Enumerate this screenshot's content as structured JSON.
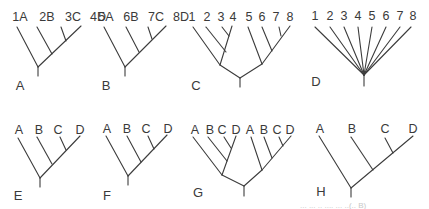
{
  "figure": {
    "background": "#ffffff",
    "line_color": "#3c3c3c",
    "text_color": "#3a3a3a",
    "trees": [
      {
        "panel": "A",
        "panel_pos": [
          20,
          90
        ],
        "tips": [
          "1A",
          "2B",
          "3C",
          "4D"
        ],
        "tip_label_pos": [
          [
            20,
            21
          ],
          [
            47,
            21
          ],
          [
            73,
            21
          ],
          [
            98,
            21
          ]
        ],
        "edges": [
          [
            17,
            27,
            38,
            67
          ],
          [
            37,
            27,
            52,
            54
          ],
          [
            61,
            27,
            66,
            41
          ],
          [
            81,
            26,
            38,
            67
          ],
          [
            38,
            67,
            38,
            76
          ]
        ]
      },
      {
        "panel": "B",
        "panel_pos": [
          106,
          90
        ],
        "tips": [
          "5A",
          "6B",
          "7C",
          "8D"
        ],
        "tip_label_pos": [
          [
            106,
            21
          ],
          [
            131,
            21
          ],
          [
            156,
            21
          ],
          [
            181,
            21
          ]
        ],
        "edges": [
          [
            104,
            27,
            125,
            67
          ],
          [
            126,
            27,
            139,
            52
          ],
          [
            148,
            27,
            152,
            39
          ],
          [
            166,
            26,
            125,
            67
          ],
          [
            125,
            67,
            125,
            76
          ]
        ]
      },
      {
        "panel": "C",
        "panel_pos": [
          196,
          90
        ],
        "tips": [
          "1",
          "2",
          "3",
          "4",
          "5",
          "6",
          "7",
          "8"
        ],
        "tip_label_pos": [
          [
            192,
            21
          ],
          [
            207,
            21
          ],
          [
            221,
            21
          ],
          [
            233,
            21
          ],
          [
            249,
            21
          ],
          [
            262,
            21
          ],
          [
            276,
            21
          ],
          [
            290,
            21
          ]
        ],
        "edges": [
          [
            193,
            27,
            220,
            65
          ],
          [
            206,
            27,
            226,
            52
          ],
          [
            222,
            27,
            229,
            36
          ],
          [
            232,
            26,
            220,
            65
          ],
          [
            248,
            27,
            262,
            64
          ],
          [
            262,
            27,
            272,
            51
          ],
          [
            279,
            27,
            281,
            36
          ],
          [
            290,
            26,
            262,
            64
          ],
          [
            220,
            65,
            240,
            78
          ],
          [
            262,
            64,
            240,
            78
          ],
          [
            240,
            78,
            240,
            87
          ]
        ]
      },
      {
        "panel": "D",
        "panel_pos": [
          316,
          86
        ],
        "tips": [
          "1",
          "2",
          "3",
          "4",
          "5",
          "6",
          "7",
          "8"
        ],
        "tip_label_pos": [
          [
            315,
            20
          ],
          [
            330,
            20
          ],
          [
            344,
            20
          ],
          [
            358,
            20
          ],
          [
            372,
            20
          ],
          [
            386,
            20
          ],
          [
            400,
            20
          ],
          [
            413,
            20
          ]
        ],
        "edges": [
          [
            315,
            27,
            364,
            75
          ],
          [
            330,
            27,
            364,
            75
          ],
          [
            344,
            27,
            364,
            75
          ],
          [
            358,
            27,
            364,
            75
          ],
          [
            372,
            27,
            364,
            75
          ],
          [
            386,
            27,
            364,
            75
          ],
          [
            400,
            27,
            364,
            75
          ],
          [
            411,
            27,
            364,
            75
          ],
          [
            364,
            75,
            364,
            86
          ]
        ]
      },
      {
        "panel": "E",
        "panel_pos": [
          18,
          200
        ],
        "tips": [
          "A",
          "B",
          "C",
          "D"
        ],
        "tip_label_pos": [
          [
            19,
            134
          ],
          [
            39,
            134
          ],
          [
            58,
            134
          ],
          [
            80,
            134
          ]
        ],
        "edges": [
          [
            18,
            138,
            40,
            178
          ],
          [
            37,
            137,
            52,
            164
          ],
          [
            60,
            137,
            66,
            150
          ],
          [
            80,
            136,
            40,
            178
          ],
          [
            40,
            178,
            40,
            187
          ]
        ]
      },
      {
        "panel": "F",
        "panel_pos": [
          107,
          200
        ],
        "tips": [
          "A",
          "B",
          "C",
          "D"
        ],
        "tip_label_pos": [
          [
            107,
            133
          ],
          [
            127,
            133
          ],
          [
            146,
            133
          ],
          [
            168,
            133
          ]
        ],
        "edges": [
          [
            106,
            136,
            128,
            176
          ],
          [
            127,
            136,
            141,
            162
          ],
          [
            148,
            136,
            154,
            149
          ],
          [
            167,
            135,
            128,
            176
          ],
          [
            128,
            176,
            128,
            185
          ]
        ]
      },
      {
        "panel": "G",
        "panel_pos": [
          198,
          197
        ],
        "tips": [
          "A",
          "B",
          "C",
          "D",
          "A",
          "B",
          "C",
          "D"
        ],
        "tip_label_pos": [
          [
            195,
            134
          ],
          [
            210,
            134
          ],
          [
            222,
            134
          ],
          [
            236,
            134
          ],
          [
            250,
            134
          ],
          [
            264,
            134
          ],
          [
            277,
            134
          ],
          [
            290,
            134
          ]
        ],
        "edges": [
          [
            193,
            137,
            222,
            175
          ],
          [
            208,
            137,
            227,
            161
          ],
          [
            224,
            137,
            231,
            148
          ],
          [
            236,
            136,
            222,
            175
          ],
          [
            251,
            137,
            262,
            170
          ],
          [
            264,
            137,
            272,
            158
          ],
          [
            279,
            137,
            283,
            146
          ],
          [
            291,
            136,
            262,
            170
          ],
          [
            222,
            175,
            244,
            186
          ],
          [
            262,
            170,
            244,
            186
          ],
          [
            244,
            186,
            244,
            196
          ]
        ]
      },
      {
        "panel": "H",
        "panel_pos": [
          321,
          196
        ],
        "tips": [
          "A",
          "B",
          "C",
          "D"
        ],
        "tip_label_pos": [
          [
            320,
            133
          ],
          [
            352,
            133
          ],
          [
            385,
            133
          ],
          [
            413,
            133
          ]
        ],
        "edges": [
          [
            319,
            136,
            351,
            188
          ],
          [
            351,
            137,
            373,
            170
          ],
          [
            385,
            138,
            393,
            153
          ],
          [
            413,
            136,
            351,
            188
          ],
          [
            351,
            188,
            351,
            197
          ]
        ]
      }
    ],
    "footer_fragment": "... ... .. .... ... ..(.. B)"
  }
}
